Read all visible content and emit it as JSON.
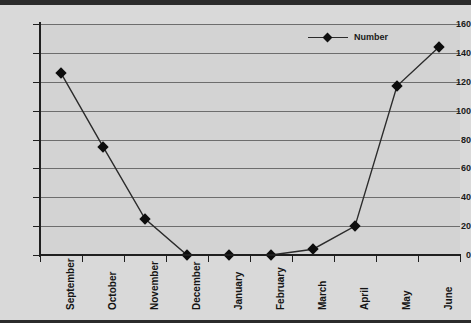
{
  "chart_data": {
    "type": "line",
    "title": "",
    "xlabel": "",
    "ylabel": "",
    "categories": [
      "September",
      "October",
      "November",
      "December",
      "January",
      "February",
      "March",
      "April",
      "May",
      "June"
    ],
    "series": [
      {
        "name": "Number",
        "values": [
          126,
          75,
          25,
          0,
          0,
          0,
          4,
          20,
          117,
          144
        ]
      }
    ],
    "ylim": [
      0,
      160
    ],
    "ytick_values": [
      0,
      20,
      40,
      60,
      80,
      100,
      120,
      140,
      160
    ],
    "ytick_labels": [
      "0",
      "20",
      "40",
      "60",
      "80",
      "100",
      "120",
      "140",
      "160"
    ],
    "grid": true,
    "legend_position": "top-right",
    "marker": "diamond",
    "colors": {
      "line": "#2b2b2b",
      "marker": "#0d0d0d",
      "plot_background": "#d3d3d3",
      "frame_background": "#d9d9d9",
      "gridline": "#6d6d6d",
      "axis": "#1f1f1f",
      "text": "#1a1a1a",
      "frame_rule": "#2b2b2b"
    }
  },
  "legend": {
    "entries": [
      {
        "label": "Number",
        "marker": "diamond-marker-icon"
      }
    ]
  }
}
